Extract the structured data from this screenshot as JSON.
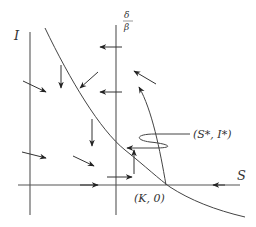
{
  "diagram": {
    "title": "",
    "axes": {
      "x_label": "S",
      "y_label": "I",
      "vertical_line_label_num": "δ",
      "vertical_line_label_den": "β"
    },
    "points": {
      "boundary_equilibrium": "(K, 0)",
      "interior_equilibrium": "(S*, I*)"
    },
    "elements": [
      "I-axis (vertical line)",
      "S-axis (horizontal line)",
      "vertical nullcline S = δ/β",
      "decreasing nullcline curve through (K,0)",
      "trajectory spiraling into (S*, I*)",
      "direction field arrows"
    ],
    "colors": {
      "line": "#444444",
      "background": "#ffffff"
    }
  }
}
